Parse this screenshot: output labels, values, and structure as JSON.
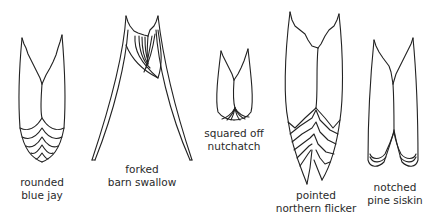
{
  "diagram": {
    "stroke_color": "#222222",
    "background": "#ffffff",
    "tails": [
      {
        "id": "rounded",
        "shape": "rounded",
        "species": "blue jay"
      },
      {
        "id": "forked",
        "shape": "forked",
        "species": "barn swallow"
      },
      {
        "id": "squared",
        "shape": "squared off",
        "species": "nutchatch"
      },
      {
        "id": "pointed",
        "shape": "pointed",
        "species": "northern flicker"
      },
      {
        "id": "notched",
        "shape": "notched",
        "species": "pine siskin"
      }
    ]
  }
}
